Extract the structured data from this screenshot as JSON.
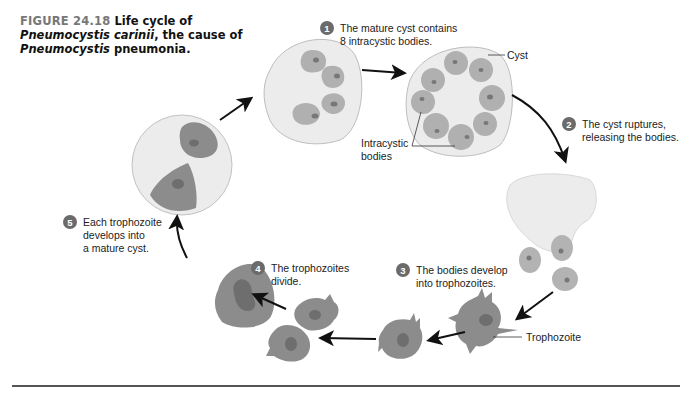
{
  "caption": {
    "figure_label": "FIGURE 24.18",
    "title_part1": "Life cycle of",
    "species_italic": "Pneumocystis carinii",
    "title_part2": ", the cause of",
    "genus_italic": "Pneumocystis",
    "title_part3": "pneumonia."
  },
  "steps": [
    {
      "number": "1",
      "text": "The mature cyst contains\n8 intracystic bodies."
    },
    {
      "number": "2",
      "text": "The cyst ruptures,\nreleasing the bodies."
    },
    {
      "number": "3",
      "text": "The bodies develop\ninto trophozoites."
    },
    {
      "number": "4",
      "text": "The trophozoites\ndivide."
    },
    {
      "number": "5",
      "text": "Each trophozoite\ndevelops into\na mature cyst."
    }
  ],
  "labels": {
    "cyst": "Cyst",
    "intracystic_bodies": "Intracystic\nbodies",
    "trophozoite": "Trophozoite"
  },
  "colors": {
    "cyst_wall_fill": "#ececec",
    "body_fill": "#b3b3b3",
    "trophozoite_fill": "#8a8a8a",
    "nucleus": "#6e6e6e",
    "badge": "#6b6b6b",
    "arrow": "#111111"
  }
}
